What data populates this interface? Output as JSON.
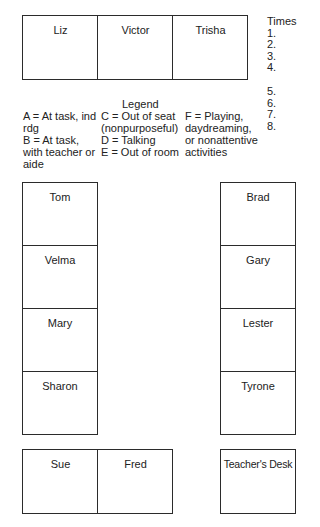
{
  "top_row": [
    "Liz",
    "Victor",
    "Trisha"
  ],
  "times": {
    "header": "Times",
    "items": [
      "1.",
      "2.",
      "3.",
      "4.",
      "5.",
      "6.",
      "7.",
      "8."
    ]
  },
  "legend": {
    "title": "Legend",
    "col1": [
      "A = At task, ind",
      "rdg",
      "B = At task,",
      "with teacher or",
      "aide"
    ],
    "col2": [
      "C = Out of seat",
      "(nonpurposeful)",
      "D = Talking",
      "E = Out of room"
    ],
    "col3": [
      "F = Playing,",
      "daydreaming,",
      "or nonattentive",
      "activities"
    ]
  },
  "left_column": [
    "Tom",
    "Velma",
    "Mary",
    "Sharon"
  ],
  "right_column": [
    "Brad",
    "Gary",
    "Lester",
    "Tyrone"
  ],
  "bottom_row": [
    "Sue",
    "Fred"
  ],
  "teacher_desk": "Teacher's Desk"
}
